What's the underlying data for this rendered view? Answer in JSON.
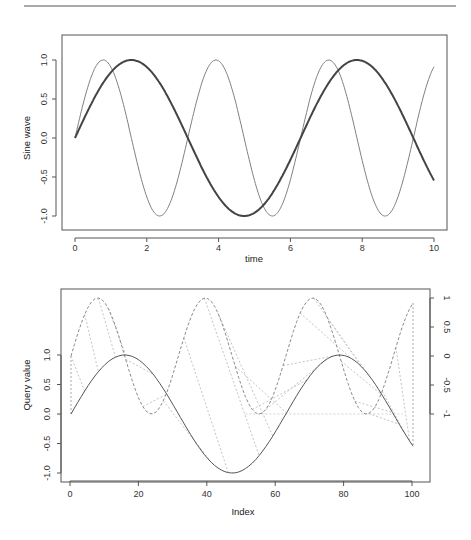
{
  "chart_data": [
    {
      "type": "line",
      "title": "",
      "xlabel": "time",
      "ylabel": "Sine wave",
      "xlim": [
        0,
        10
      ],
      "ylim": [
        -1,
        1
      ],
      "grid": false,
      "xticks": [
        "0",
        "2",
        "4",
        "6",
        "8",
        "10"
      ],
      "yticks": [
        "-1.0",
        "-0.5",
        "0.0",
        "0.5",
        "1.0"
      ],
      "series": [
        {
          "name": "sin(t)",
          "style": "solid-thick",
          "color": "#444444",
          "formula": "sin(t)",
          "x_range": [
            0,
            10
          ]
        },
        {
          "name": "sin(2t)",
          "style": "solid-thin",
          "color": "#777777",
          "formula": "sin(2t)",
          "x_range": [
            0,
            10
          ]
        }
      ]
    },
    {
      "type": "line",
      "title": "",
      "xlabel": "Index",
      "ylabel": "Query value",
      "xlim": [
        1,
        101
      ],
      "ylim": [
        -1,
        1
      ],
      "grid": false,
      "xticks": [
        "0",
        "20",
        "40",
        "60",
        "80",
        "100"
      ],
      "yticks": [
        "-1.0",
        "-0.5",
        "0.0",
        "0.5",
        "1.0"
      ],
      "right_axis_ticks": [
        "-1",
        "-0.5",
        "0",
        "0.5",
        "1"
      ],
      "series": [
        {
          "name": "query",
          "style": "solid",
          "color": "#555555",
          "formula": "sin(t)",
          "n": 101
        },
        {
          "name": "reference",
          "style": "dashed",
          "color": "#888888",
          "formula": "sin(2t)",
          "axis": "right",
          "n": 101
        },
        {
          "name": "alignment",
          "style": "dotted",
          "color": "#bbbbbb",
          "note": "DTW warping-path matching lines between query and reference"
        }
      ]
    }
  ],
  "plot1": {
    "xlabel": "time",
    "ylabel": "Sine wave",
    "xticks": [
      "0",
      "2",
      "4",
      "6",
      "8",
      "10"
    ],
    "yticks": [
      "-1.0",
      "-0.5",
      "0.0",
      "0.5",
      "1.0"
    ]
  },
  "plot2": {
    "xlabel": "Index",
    "ylabel": "Query value",
    "xticks": [
      "0",
      "20",
      "40",
      "60",
      "80",
      "100"
    ],
    "yticks": [
      "-1.0",
      "-0.5",
      "0.0",
      "0.5",
      "1.0"
    ],
    "rticks": [
      "-1",
      "-0.5",
      "0",
      "0.5",
      "1"
    ]
  },
  "colors": {
    "frame": "#555555",
    "thick_line": "#444444",
    "thin_line": "#808080",
    "dashed": "#8a8a8a",
    "dotted": "#c4c4c4"
  }
}
